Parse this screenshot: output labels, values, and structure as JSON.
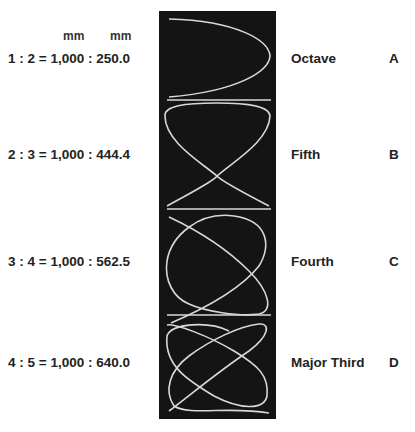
{
  "units": {
    "left": "mm",
    "right": "mm"
  },
  "rows": [
    {
      "ratio": "1 : 2 = 1,000 : 250.0",
      "interval": "Octave",
      "letter": "A"
    },
    {
      "ratio": "2 : 3 = 1,000 : 444.4",
      "interval": "Fifth",
      "letter": "B"
    },
    {
      "ratio": "3 : 4 = 1,000 : 562.5",
      "interval": "Fourth",
      "letter": "C"
    },
    {
      "ratio": "4 : 5 = 1,000 : 640.0",
      "interval": "Major Third",
      "letter": "D"
    }
  ],
  "colors": {
    "panel": "#141414",
    "curve": "#d8d8d8"
  }
}
